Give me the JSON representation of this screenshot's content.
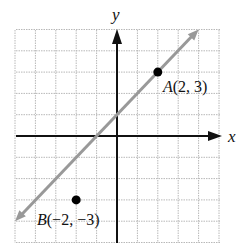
{
  "chart_data": {
    "type": "line",
    "title": "",
    "xlabel": "x",
    "ylabel": "y",
    "xlim": [
      -5,
      5
    ],
    "ylim": [
      -5,
      5
    ],
    "grid": true,
    "grid_step": 1,
    "series": [
      {
        "name": "line through A and B? (y = x + 1)",
        "kind": "line",
        "x": [
          -5,
          4
        ],
        "y": [
          -4,
          5
        ],
        "color": "#999999",
        "arrows": "both"
      },
      {
        "name": "points",
        "kind": "scatter",
        "points": [
          {
            "label": "A",
            "x": 2,
            "y": 3
          },
          {
            "label": "B",
            "x": -2,
            "y": -3
          }
        ],
        "color": "#000000"
      }
    ],
    "annotations": [
      {
        "text": "A(2, 3)",
        "x": 2,
        "y": 3
      },
      {
        "text": "B(−2, −3)",
        "x": -2,
        "y": -3
      }
    ]
  },
  "labels": {
    "x_axis": "x",
    "y_axis": "y",
    "point_a_name": "A",
    "point_a_coords": "(2, 3)",
    "point_b_name": "B",
    "point_b_coords": "(−2, −3)"
  },
  "colors": {
    "grid": "#b8b8b8",
    "axis": "#111111",
    "line": "#9a9a9a",
    "point": "#000000"
  }
}
